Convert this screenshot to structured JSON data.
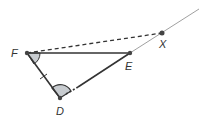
{
  "diagram": {
    "points": {
      "F": {
        "label": "F",
        "x": 27,
        "y": 53
      },
      "E": {
        "label": "E",
        "x": 130,
        "y": 53
      },
      "X": {
        "label": "X",
        "x": 162,
        "y": 33
      },
      "D": {
        "label": "D",
        "x": 60,
        "y": 98
      }
    },
    "segments": [
      {
        "from": "F",
        "to": "E",
        "style": "solid"
      },
      {
        "from": "F",
        "to": "D",
        "style": "solid",
        "tick_marks": 1
      },
      {
        "from": "D",
        "to": "E",
        "style": "solid"
      },
      {
        "from": "F",
        "to": "X",
        "style": "dashed"
      }
    ],
    "rays": [
      {
        "from": "E",
        "through": "X",
        "style": "thin"
      }
    ],
    "angle_marks": [
      {
        "vertex": "F",
        "shaded": true
      },
      {
        "vertex": "D",
        "shaded": true
      }
    ],
    "colors": {
      "line": "#333333",
      "shade": "#c8ccd0",
      "ray": "#888888"
    }
  }
}
